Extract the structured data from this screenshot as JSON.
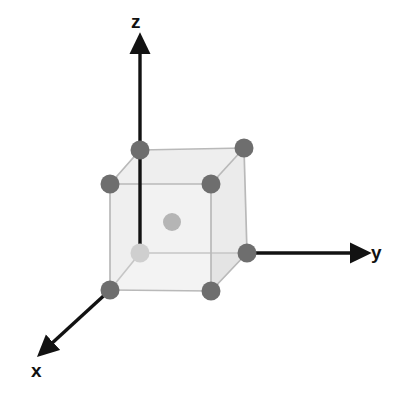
{
  "figure": {
    "name": "body-centered-cubic-unit-cell",
    "title": "",
    "background_color": "#ffffff"
  },
  "axes": {
    "z": {
      "label": "z",
      "color": "#121212",
      "line": {
        "x1": 140,
        "y1": 253,
        "x2": 140,
        "y2": 44
      },
      "arrow_at": "top"
    },
    "y": {
      "label": "y",
      "color": "#121212",
      "line": {
        "x1": 247,
        "y1": 253,
        "x2": 360,
        "y2": 253
      },
      "arrow_at": "right"
    },
    "x": {
      "label": "x",
      "color": "#121212",
      "line": {
        "x1": 110,
        "y1": 290,
        "x2": 44,
        "y2": 351
      },
      "arrow_at": "lower-left"
    }
  },
  "chart_data": {
    "type": "scatter",
    "xlabel": "x",
    "ylabel": "y",
    "zlabel": "z",
    "projection": "oblique-3d",
    "cube_edge_color": "#b9b9b9",
    "cube_face_colors": {
      "top": "#ececec",
      "front": "#f3f3f3",
      "right": "#e4e4e4"
    },
    "atom_colors": {
      "corner": "#6e6e6e",
      "origin_corner": "#cfcfcf",
      "body_center": "#b5b5b5"
    },
    "atom_radius_px": 9.5,
    "atoms": [
      {
        "name": "corner-back-bottom-left-origin",
        "lattice": [
          0,
          0,
          0
        ],
        "cx": 140,
        "cy": 253,
        "r": 9.5,
        "shade": "origin_corner",
        "hidden": true
      },
      {
        "name": "corner-back-bottom-right",
        "lattice": [
          0,
          1,
          0
        ],
        "cx": 247,
        "cy": 253,
        "r": 9.5,
        "shade": "corner"
      },
      {
        "name": "corner-front-bottom-left",
        "lattice": [
          1,
          0,
          0
        ],
        "cx": 110,
        "cy": 290,
        "r": 9.5,
        "shade": "corner"
      },
      {
        "name": "corner-front-bottom-right",
        "lattice": [
          1,
          1,
          0
        ],
        "cx": 211,
        "cy": 291,
        "r": 9.5,
        "shade": "corner"
      },
      {
        "name": "corner-back-top-left",
        "lattice": [
          0,
          0,
          1
        ],
        "cx": 140,
        "cy": 150,
        "r": 9.5,
        "shade": "corner"
      },
      {
        "name": "corner-back-top-right",
        "lattice": [
          0,
          1,
          1
        ],
        "cx": 244,
        "cy": 148,
        "r": 9.5,
        "shade": "corner"
      },
      {
        "name": "corner-front-top-left",
        "lattice": [
          1,
          0,
          1
        ],
        "cx": 110,
        "cy": 184,
        "r": 9.5,
        "shade": "corner"
      },
      {
        "name": "corner-front-top-right",
        "lattice": [
          1,
          1,
          1
        ],
        "cx": 211,
        "cy": 184,
        "r": 9.5,
        "shade": "corner"
      },
      {
        "name": "body-center-atom",
        "lattice": [
          0.5,
          0.5,
          0.5
        ],
        "cx": 172,
        "cy": 222,
        "r": 9.0,
        "shade": "body_center"
      }
    ],
    "atom_count": 9,
    "corner_atom_count": 8,
    "body_center_atom_count": 1,
    "legend": [],
    "grid": false
  }
}
